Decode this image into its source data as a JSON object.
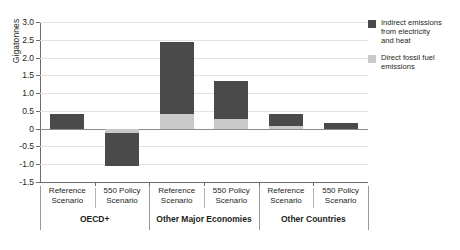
{
  "chart_data": {
    "type": "bar",
    "title": "",
    "subtitle": "",
    "xlabel": "",
    "ylabel": "Gigatonnes",
    "ylim": [
      -1.5,
      3.0
    ],
    "yticks": [
      "3.0",
      "2.5",
      "2.0",
      "1.5",
      "1.0",
      "0.5",
      "0",
      "-0.5",
      "-1.0",
      "-1.5"
    ],
    "ytick_values": [
      3.0,
      2.5,
      2.0,
      1.5,
      1.0,
      0.5,
      0,
      -0.5,
      -1.0,
      -1.5
    ],
    "grid": true,
    "stacked": true,
    "legend_position": "right",
    "categories": [
      "Reference Scenario",
      "550 Policy Scenario",
      "Reference Scenario",
      "550 Policy Scenario",
      "Reference Scenario",
      "550 Policy Scenario"
    ],
    "groups": [
      {
        "label": "OECD+",
        "span": 2
      },
      {
        "label": "Other Major Economies",
        "span": 2
      },
      {
        "label": "Other Countries",
        "span": 2
      }
    ],
    "series": [
      {
        "name": "Direct fossil fuel emissions",
        "color": "#c9c9c9",
        "values": [
          0.0,
          -0.13,
          0.42,
          0.27,
          0.08,
          0.0
        ]
      },
      {
        "name": "Indirect emissions from electricity and heat",
        "color": "#4a4a4a",
        "values": [
          0.42,
          -0.92,
          2.03,
          1.06,
          0.32,
          0.15
        ]
      }
    ],
    "totals": [
      0.42,
      -1.05,
      2.45,
      1.33,
      0.4,
      0.15
    ]
  },
  "legend": {
    "items": [
      {
        "name": "indirect-emissions",
        "color": "#4a4a4a",
        "line1": "Indirect emissions",
        "line2": "from electricity",
        "line3": "and heat"
      },
      {
        "name": "direct-emissions",
        "color": "#c9c9c9",
        "line1": "Direct fossil fuel",
        "line2": "emissions",
        "line3": ""
      }
    ]
  }
}
